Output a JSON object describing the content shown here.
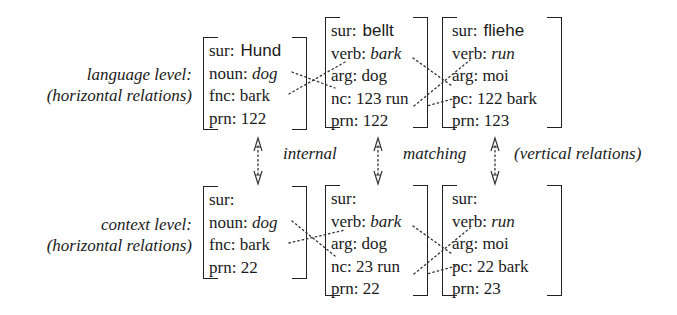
{
  "levels": {
    "language": {
      "label_line1": "language level:",
      "label_line2": "(horizontal relations)"
    },
    "context": {
      "label_line1": "context level:",
      "label_line2": "(horizontal relations)"
    }
  },
  "vertical_labels": {
    "internal": "internal",
    "matching": "matching",
    "vertical": "(vertical relations)"
  },
  "language_boxes": [
    {
      "rows": [
        {
          "attr": "sur:",
          "value": "Hund",
          "style": "sans"
        },
        {
          "attr": "noun:",
          "value": "dog",
          "style": "italic"
        },
        {
          "attr": "fnc:",
          "value": "bark",
          "style": "plain"
        },
        {
          "attr": "prn:",
          "value": "122",
          "style": "plain"
        }
      ]
    },
    {
      "rows": [
        {
          "attr": "sur:",
          "value": "bellt",
          "style": "sans"
        },
        {
          "attr": "verb:",
          "value": "bark",
          "style": "italic"
        },
        {
          "attr": "arg:",
          "value": "dog",
          "style": "plain"
        },
        {
          "attr": "nc:",
          "value": "123 run",
          "style": "plain"
        },
        {
          "attr": "prn:",
          "value": "122",
          "style": "plain"
        }
      ]
    },
    {
      "rows": [
        {
          "attr": "sur:",
          "value": "fliehe",
          "style": "sans"
        },
        {
          "attr": "verb:",
          "value": "run",
          "style": "italic"
        },
        {
          "attr": "arg:",
          "value": "moi",
          "style": "plain"
        },
        {
          "attr": "pc:",
          "value": "122 bark",
          "style": "plain"
        },
        {
          "attr": "prn:",
          "value": "123",
          "style": "plain"
        }
      ]
    }
  ],
  "context_boxes": [
    {
      "rows": [
        {
          "attr": "sur:",
          "value": "",
          "style": "sans"
        },
        {
          "attr": "noun:",
          "value": "dog",
          "style": "italic"
        },
        {
          "attr": "fnc:",
          "value": "bark",
          "style": "plain"
        },
        {
          "attr": "prn:",
          "value": "22",
          "style": "plain"
        }
      ]
    },
    {
      "rows": [
        {
          "attr": "sur:",
          "value": "",
          "style": "sans"
        },
        {
          "attr": "verb:",
          "value": "bark",
          "style": "italic"
        },
        {
          "attr": "arg:",
          "value": "dog",
          "style": "plain"
        },
        {
          "attr": "nc:",
          "value": "23 run",
          "style": "plain"
        },
        {
          "attr": "prn:",
          "value": "22",
          "style": "plain"
        }
      ]
    },
    {
      "rows": [
        {
          "attr": "sur:",
          "value": "",
          "style": "sans"
        },
        {
          "attr": "verb:",
          "value": "run",
          "style": "italic"
        },
        {
          "attr": "arg:",
          "value": "moi",
          "style": "plain"
        },
        {
          "attr": "pc:",
          "value": "22 bark",
          "style": "plain"
        },
        {
          "attr": "prn:",
          "value": "23",
          "style": "plain"
        }
      ]
    }
  ]
}
